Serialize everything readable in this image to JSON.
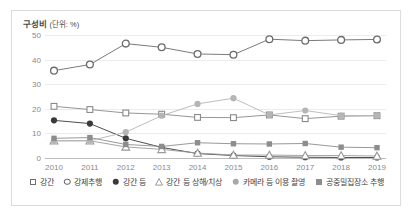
{
  "top_strip": {
    "ghost_text": "· · · · · · · · · · · · · · · · · · · ·"
  },
  "figure": {
    "axis_unit_title": "구성비",
    "axis_unit_suffix": "(단위: %)"
  },
  "chart_data": {
    "type": "line",
    "title": "구성비 (단위: %)",
    "xlabel": "",
    "ylabel": "구성비 (단위: %)",
    "ylim": [
      0,
      50
    ],
    "yticks": [
      0,
      10,
      20,
      30,
      40,
      50
    ],
    "grid": true,
    "legend_position": "bottom",
    "x": [
      2010,
      2011,
      2012,
      2013,
      2014,
      2015,
      2016,
      2017,
      2018,
      2019
    ],
    "categories": [
      "2010",
      "2011",
      "2012",
      "2013",
      "2014",
      "2015",
      "2016",
      "2017",
      "2018",
      "2019"
    ],
    "series": [
      {
        "name": "강간",
        "marker": "square-open",
        "color": "#8a8a8a",
        "values": [
          21.0,
          19.7,
          18.3,
          17.8,
          16.5,
          16.4,
          17.5,
          16.0,
          17.0,
          17.2
        ]
      },
      {
        "name": "강제추행",
        "marker": "circle-open",
        "color": "#6b6b6b",
        "values": [
          35.5,
          38.0,
          46.5,
          45.0,
          42.3,
          42.0,
          48.3,
          47.7,
          48.0,
          48.2
        ]
      },
      {
        "name": "강간 등",
        "marker": "circle-filled-dark",
        "color": "#3a3a3a",
        "values": [
          15.3,
          14.0,
          8.0,
          4.3,
          1.8,
          1.0,
          0.5,
          0.3,
          0.2,
          0.2
        ]
      },
      {
        "name": "강간 등 상해/치상",
        "marker": "triangle-open",
        "color": "#9a9a9a",
        "values": [
          7.0,
          7.0,
          4.5,
          3.5,
          2.0,
          1.2,
          1.2,
          1.0,
          1.0,
          0.8
        ]
      },
      {
        "name": "카메라 등 이용 촬영",
        "marker": "circle-filled-gray",
        "color": "#b5b5b5",
        "values": [
          7.0,
          7.0,
          10.5,
          17.2,
          22.0,
          24.3,
          17.5,
          19.3,
          17.2,
          17.2
        ]
      },
      {
        "name": "공중밀집장소 추행",
        "marker": "square-filled-gray",
        "color": "#8d8d8d",
        "values": [
          8.0,
          8.3,
          5.5,
          4.7,
          6.2,
          5.8,
          5.7,
          5.9,
          4.4,
          4.2
        ]
      }
    ]
  },
  "legend": {
    "items": [
      {
        "label": "강간",
        "marker": "square-open"
      },
      {
        "label": "강제추행",
        "marker": "circle-open"
      },
      {
        "label": "강간 등",
        "marker": "circle-filled-dark"
      },
      {
        "label": "강간 등 상해/치상",
        "marker": "triangle-open"
      },
      {
        "label": "카메라 등 이용 촬영",
        "marker": "circle-filled-gray"
      },
      {
        "label": "공중밀집장소 추행",
        "marker": "square-filled-gray"
      }
    ]
  }
}
